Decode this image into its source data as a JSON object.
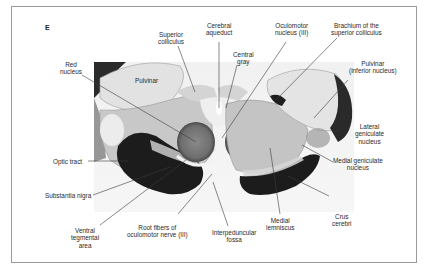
{
  "figure": {
    "panel_letter": "E"
  },
  "labels": {
    "superior_colliculus": "Superior\ncolliculus",
    "cerebral_aqueduct": "Cerebral\naqueduct",
    "oculomotor_nucleus": "Oculomotor\nnucleus (III)",
    "brachium_superior_colliculus": "Brachium of the\nsuperior colliculus",
    "central_gray": "Central\ngray",
    "red_nucleus": "Red\nnucleus",
    "pulvinar_left": "Pulvinar",
    "pulvinar_inferior": "Pulvinar\n(inferior nucleus)",
    "lateral_geniculate": "Lateral\ngeniculate\nnucleus",
    "medial_geniculate": "Medial geniculate\nnucleus",
    "optic_tract": "Optic tract",
    "substantia_nigra": "Substantia nigra",
    "ventral_tegmental_area": "Ventral\ntegmental\narea",
    "root_fibers_oculomotor": "Root fibers of\noculomotor nerve (III)",
    "interpeduncular_fossa": "Interpeduncular\nfossa",
    "medial_lemniscus": "Medial\nlemniscus",
    "crus_cerebri": "Crus\ncerebri"
  },
  "colors": {
    "frame_border": "#9a9a9a",
    "leader_line": "#3a3a3a",
    "text": "#2a2a2a",
    "tissue_light": "#e6e6e6",
    "tissue_mid": "#b9b9b9",
    "tissue_dark": "#1c1c1c"
  }
}
